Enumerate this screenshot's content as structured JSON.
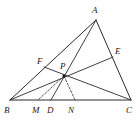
{
  "figure": {
    "kind": "triangle-with-cevians",
    "background_color": "#ffffff",
    "line_color": "#2b2b2b",
    "dashed_color": "#3a3a3a",
    "points": {
      "A": {
        "label": "A",
        "x": 96,
        "y": 20,
        "label_x": 92,
        "label_y": 13
      },
      "B": {
        "label": "B",
        "x": 10,
        "y": 100,
        "label_x": 4,
        "label_y": 113
      },
      "C": {
        "label": "C",
        "x": 131,
        "y": 100,
        "label_x": 126,
        "label_y": 113
      },
      "E": {
        "label": "E",
        "x": 113,
        "y": 57,
        "label_x": 115,
        "label_y": 54
      },
      "F": {
        "label": "F",
        "x": 44,
        "y": 67,
        "label_x": 37,
        "label_y": 64
      },
      "P": {
        "label": "P",
        "x": 64,
        "y": 76,
        "label_x": 60,
        "label_y": 69
      },
      "M": {
        "label": "M",
        "x": 38,
        "y": 100,
        "label_x": 32,
        "label_y": 113
      },
      "D": {
        "label": "D",
        "x": 51,
        "y": 100,
        "label_x": 47,
        "label_y": 113
      },
      "N": {
        "label": "N",
        "x": 75,
        "y": 100,
        "label_x": 68,
        "label_y": 113
      }
    },
    "solid_segments": [
      {
        "name": "side-AB",
        "from": "A",
        "to": "B"
      },
      {
        "name": "side-BC",
        "from": "B",
        "to": "C"
      },
      {
        "name": "side-CA",
        "from": "C",
        "to": "A"
      },
      {
        "name": "cevian-AD",
        "from": "A",
        "to": "D"
      },
      {
        "name": "cevian-BE",
        "from": "B",
        "to": "E"
      },
      {
        "name": "cevian-CF",
        "from": "C",
        "to": "F"
      }
    ],
    "dashed_segments": [
      {
        "name": "dashed-PM",
        "from": "P",
        "to": "M"
      },
      {
        "name": "dashed-PN",
        "from": "P",
        "to": "N"
      }
    ],
    "marked_points": [
      "P"
    ],
    "vertex_labels": [
      "A",
      "B",
      "C",
      "E",
      "F",
      "P",
      "M",
      "D",
      "N"
    ]
  }
}
